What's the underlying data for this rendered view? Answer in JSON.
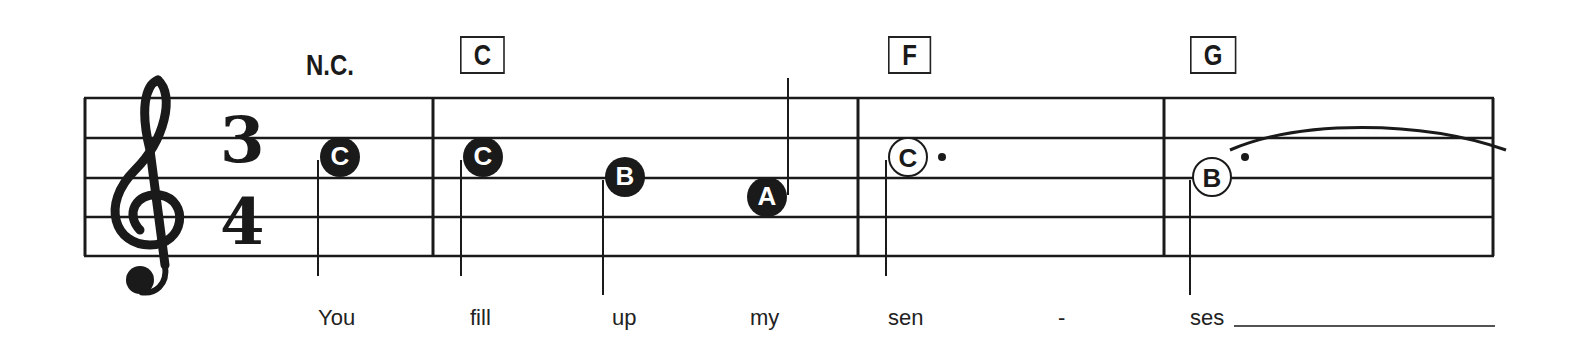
{
  "staff": {
    "clef": "treble-clef",
    "time_signature": {
      "top": "3",
      "bottom": "4"
    },
    "line_color": "#1a1a1a"
  },
  "chords": [
    {
      "label": "N.C.",
      "boxed": false
    },
    {
      "label": "C",
      "boxed": true
    },
    {
      "label": "F",
      "boxed": true
    },
    {
      "label": "G",
      "boxed": true
    }
  ],
  "notes": [
    {
      "letter": "C",
      "type": "quarter",
      "style": "filled"
    },
    {
      "letter": "C",
      "type": "quarter",
      "style": "filled"
    },
    {
      "letter": "B",
      "type": "quarter",
      "style": "filled"
    },
    {
      "letter": "A",
      "type": "quarter",
      "style": "filled"
    },
    {
      "letter": "C",
      "type": "dotted-half",
      "style": "open"
    },
    {
      "letter": "B",
      "type": "dotted-half",
      "style": "open",
      "tied": true
    }
  ],
  "lyrics": [
    "You",
    "fill",
    "up",
    "my",
    "sen",
    "-",
    "ses"
  ]
}
